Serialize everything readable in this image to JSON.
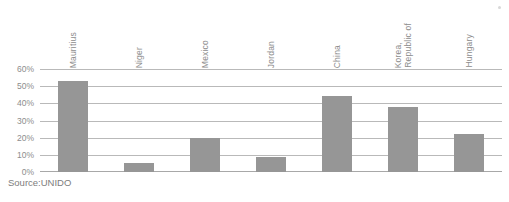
{
  "source_note": "Source:UNIDO",
  "chart_data": {
    "type": "bar",
    "title": "",
    "subtitle": "",
    "xlabel": "",
    "ylabel": "",
    "ylim": [
      0,
      60
    ],
    "y_tick_labels": [
      "60%",
      "50%",
      "40%",
      "30%",
      "20%",
      "10%",
      "0%"
    ],
    "y_tick_values": [
      60,
      50,
      40,
      30,
      20,
      10,
      0
    ],
    "grid": true,
    "legend": false,
    "legend_position": "none",
    "orientation": "vertical",
    "category_label_rotation": 90,
    "bar_color": "#969696",
    "gridline_color": "#b9b9b9",
    "text_color": "#8d8d8d",
    "categories": [
      "Mauritius",
      "Niger",
      "Mexico",
      "Jordan",
      "China",
      "Korea, Republic of",
      "Hungary"
    ],
    "category_lines": [
      [
        "Mauritius"
      ],
      [
        "Niger"
      ],
      [
        "Mexico"
      ],
      [
        "Jordan"
      ],
      [
        "China"
      ],
      [
        "Korea,",
        "Republic of"
      ],
      [
        "Hungary"
      ]
    ],
    "values": [
      53,
      5,
      20,
      8.5,
      44,
      38,
      22
    ],
    "value_unit": "%"
  }
}
